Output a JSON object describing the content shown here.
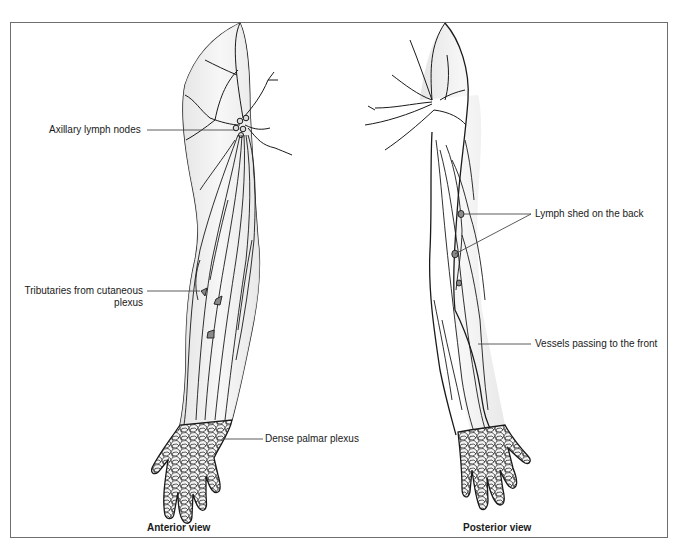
{
  "figure": {
    "views": [
      {
        "id": "anterior",
        "caption": "Anterior view",
        "labels": [
          {
            "id": "axillary",
            "text": "Axillary lymph nodes"
          },
          {
            "id": "tributaries",
            "line1": "Tributaries from cutaneous",
            "line2": "plexus"
          },
          {
            "id": "palmar",
            "text": "Dense palmar plexus"
          }
        ]
      },
      {
        "id": "posterior",
        "caption": "Posterior view",
        "labels": [
          {
            "id": "lymph-shed",
            "text": "Lymph shed on the back"
          },
          {
            "id": "vessels",
            "text": "Vessels passing to the front"
          }
        ]
      }
    ],
    "colors": {
      "outline": "#1a1a1a",
      "skin_fill": "#ececec",
      "frame": "#6e6e6e",
      "leader_line": "#4a4a4a",
      "node_fill": "#8a8a8a"
    }
  }
}
